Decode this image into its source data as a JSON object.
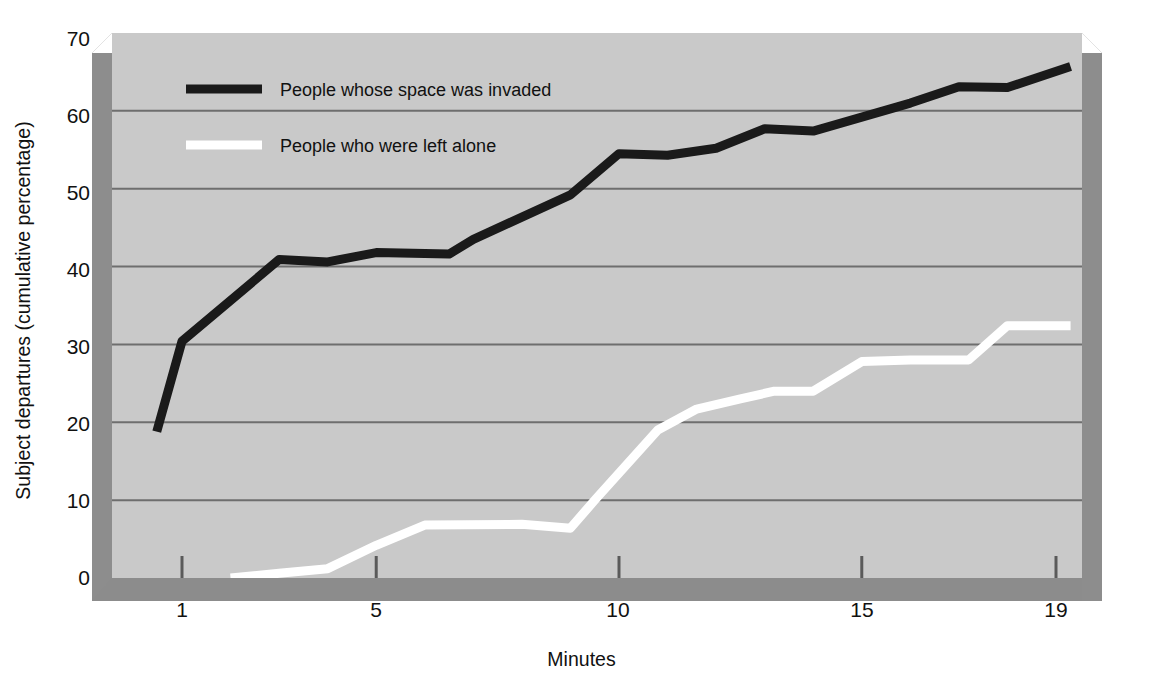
{
  "chart_data": {
    "type": "line",
    "title": "",
    "xlabel": "Minutes",
    "ylabel": "Subject departures (cumulative percentage)",
    "xlim": [
      0.5,
      19.3
    ],
    "ylim": [
      0,
      70
    ],
    "xticks": [
      1,
      5,
      10,
      15,
      19
    ],
    "yticks": [
      0,
      10,
      20,
      30,
      40,
      50,
      60,
      70
    ],
    "grid": "horizontal",
    "legend_position": "upper-left-inside",
    "plot_background": "#c9c9c9",
    "gridline_color": "#6e6e6e",
    "series": [
      {
        "name": "People whose space was invaded",
        "color": "#1a1a1a",
        "x": [
          0.48,
          1.0,
          3.0,
          4.0,
          5.0,
          6.5,
          7.0,
          9.0,
          10.0,
          11.0,
          12.0,
          13.0,
          14.0,
          16.0,
          17.0,
          18.0,
          19.3
        ],
        "y": [
          18.8,
          30.4,
          40.9,
          40.6,
          41.8,
          41.6,
          43.5,
          49.2,
          54.5,
          54.3,
          55.2,
          57.7,
          57.4,
          61.0,
          63.1,
          63.0,
          65.7
        ]
      },
      {
        "name": "People who were left alone",
        "color": "#ffffff",
        "x": [
          2.0,
          3.0,
          4.0,
          5.0,
          6.0,
          8.0,
          9.0,
          9.5,
          10.8,
          11.6,
          12.5,
          13.2,
          14.0,
          15.0,
          16.0,
          17.2,
          18.0,
          19.3
        ],
        "y": [
          0.0,
          0.6,
          1.2,
          4.2,
          6.8,
          6.9,
          6.4,
          10.0,
          19.0,
          21.7,
          23.0,
          24.0,
          24.0,
          27.8,
          28.0,
          28.0,
          32.4,
          32.4
        ]
      }
    ]
  },
  "legend": {
    "items": [
      {
        "label": "People whose space was invaded",
        "color": "#1a1a1a"
      },
      {
        "label": "People who were left alone",
        "color": "#ffffff"
      }
    ]
  },
  "axes": {
    "y_tick_labels": [
      "70",
      "60",
      "50",
      "40",
      "30",
      "20",
      "10",
      "0"
    ],
    "x_tick_labels": [
      "1",
      "5",
      "10",
      "15",
      "19"
    ],
    "y_axis_title": "Subject departures (cumulative percentage)",
    "x_axis_title": "Minutes"
  }
}
